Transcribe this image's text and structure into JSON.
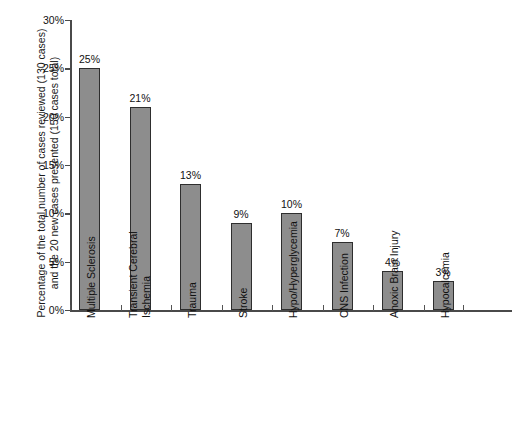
{
  "chart_data": {
    "type": "bar",
    "title": "",
    "subtitle": "",
    "xlabel": "",
    "ylabel": "Percentage of the total number of cases reviewed (130 cases) and the 20 new cases presented (150 cases total)",
    "ylabel_lines": [
      "Percentage of the total number of cases reviewed (130 cases)",
      "and the 20 new cases presented (150 cases total)"
    ],
    "categories": [
      "Multiple Sclerosis",
      "Transient Cerebral Ischemia",
      "Trauma",
      "Stroke",
      "Hypo/Hyperglycemia",
      "CNS Infection",
      "Anoxic Brain Injury",
      "Hypocalcemia"
    ],
    "category_label_lines": [
      [
        "Multiple Sclerosis"
      ],
      [
        "Transient Cerebral",
        "Ischemia"
      ],
      [
        "Trauma"
      ],
      [
        "Stroke"
      ],
      [
        "Hypo/Hyperglycemia"
      ],
      [
        "CNS Infection"
      ],
      [
        "Anoxic Brain Injury"
      ],
      [
        "Hypocalcemia"
      ]
    ],
    "values": [
      25,
      21,
      13,
      9,
      10,
      7,
      4,
      3
    ],
    "data_labels": [
      "25%",
      "21%",
      "13%",
      "9%",
      "10%",
      "7%",
      "4%",
      "3%"
    ],
    "ylim": [
      0,
      30
    ],
    "y_ticks": [
      0,
      5,
      10,
      15,
      20,
      25,
      30
    ],
    "y_tick_labels": [
      "0%",
      "5%",
      "10%",
      "15%",
      "20%",
      "25%",
      "30%"
    ],
    "grid": false,
    "legend": false,
    "legend_position": "none",
    "bar_fill_color": "#8d8d8d",
    "bar_border_color": "#2e2e2e",
    "axis_color": "#4a4a4a",
    "background_color": "#ffffff"
  }
}
